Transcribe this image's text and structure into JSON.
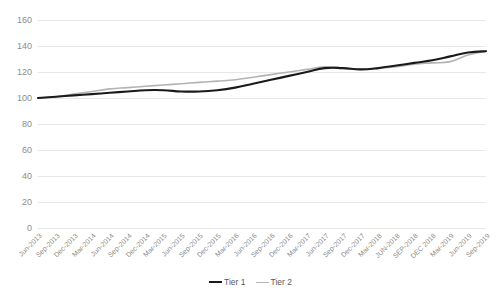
{
  "chart_data": {
    "type": "line",
    "title": "",
    "subtitle": "",
    "xlabel": "",
    "ylabel": "",
    "ylim": [
      0,
      160
    ],
    "yticks": [
      0,
      20,
      40,
      60,
      80,
      100,
      120,
      140,
      160
    ],
    "grid": true,
    "legend_position": "bottom",
    "categories": [
      "Jun-2013",
      "Sep-2013",
      "Dec-2013",
      "Mar-2014",
      "Jun-2014",
      "Sep-2014",
      "Dec-2014",
      "Mar-2015",
      "Jun-2015",
      "Sep-2015",
      "Dec-2015",
      "Mar-2016",
      "Jun-2016",
      "Sep-2016",
      "Dec-2016",
      "Mar-2017",
      "Jun-2017",
      "Sep-2017",
      "Dec-2017",
      "Mar-2018",
      "JUN-2018",
      "SEP-2018",
      "DEC 2018",
      "Mar-2019",
      "Jun-2019",
      "Sep-2019"
    ],
    "series": [
      {
        "name": "Tier 1",
        "color": "#1a1a1a",
        "width": 2.1,
        "values": [
          100,
          101,
          102,
          103,
          104,
          105,
          106,
          106,
          105,
          105,
          106,
          108,
          111,
          114,
          117,
          120,
          123,
          123,
          122,
          123,
          125,
          127,
          129,
          132,
          135,
          136
        ]
      },
      {
        "name": "Tier 2",
        "color": "#b3b3b3",
        "width": 1.6,
        "values": [
          100,
          101,
          103,
          105,
          107,
          108,
          109,
          110,
          111,
          112,
          113,
          114,
          116,
          118,
          120,
          122,
          124,
          123,
          122,
          123,
          124,
          126,
          127,
          128,
          133,
          136
        ]
      }
    ]
  },
  "legend": {
    "entries": [
      {
        "label": "Tier 1"
      },
      {
        "label": "Tier 2"
      }
    ]
  }
}
